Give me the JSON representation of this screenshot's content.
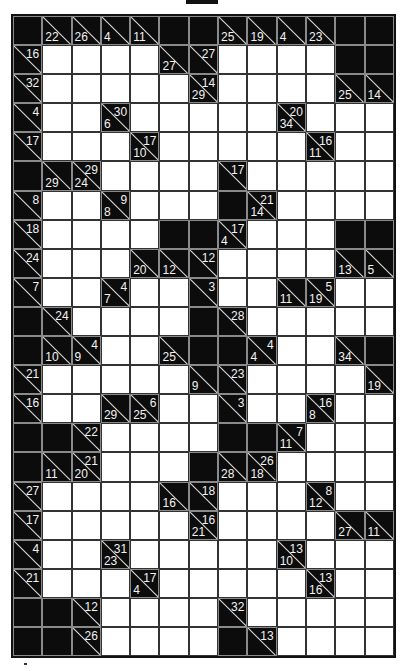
{
  "puzzle": {
    "type": "kakuro",
    "rows": 22,
    "cols": 13,
    "legend": {
      "B": "black block",
      "W": "white entry cell",
      "clue": "d = down sum (bottom-left), r = right sum (top-right)"
    },
    "grid": [
      [
        "B",
        {
          "d": 22
        },
        {
          "d": 26
        },
        {
          "d": 4
        },
        {
          "d": 11
        },
        "B",
        "B",
        {
          "d": 25
        },
        {
          "d": 19
        },
        {
          "d": 4
        },
        {
          "d": 23
        },
        "B",
        "B"
      ],
      [
        {
          "r": 16
        },
        "W",
        "W",
        "W",
        "W",
        {
          "d": 27
        },
        {
          "r": 27
        },
        "W",
        "W",
        "W",
        "W",
        "B",
        "B"
      ],
      [
        {
          "r": 32
        },
        "W",
        "W",
        "W",
        "W",
        "W",
        {
          "d": 29,
          "r": 14
        },
        "W",
        "W",
        "W",
        "W",
        {
          "d": 25
        },
        {
          "d": 14
        }
      ],
      [
        {
          "r": 4
        },
        "W",
        "W",
        {
          "d": 6,
          "r": 30
        },
        "W",
        "W",
        "W",
        "W",
        "W",
        {
          "d": 34,
          "r": 20
        },
        "W",
        "W",
        "W"
      ],
      [
        {
          "r": 17
        },
        "W",
        "W",
        "W",
        {
          "d": 10,
          "r": 17
        },
        "W",
        "W",
        "W",
        "W",
        "W",
        {
          "d": 11,
          "r": 16
        },
        "W",
        "W"
      ],
      [
        "B",
        {
          "d": 29
        },
        {
          "d": 24,
          "r": 29
        },
        "W",
        "W",
        "W",
        "W",
        {
          "r": 17
        },
        "W",
        "W",
        "W",
        "W",
        "W"
      ],
      [
        {
          "r": 8
        },
        "W",
        "W",
        {
          "d": 8,
          "r": 9
        },
        "W",
        "W",
        "W",
        "B",
        {
          "d": 14,
          "r": 21
        },
        "W",
        "W",
        "W",
        "W"
      ],
      [
        {
          "r": 18
        },
        "W",
        "W",
        "W",
        "W",
        "B",
        "B",
        {
          "d": 4,
          "r": 17
        },
        "W",
        "W",
        "W",
        "B",
        "B"
      ],
      [
        {
          "r": 24
        },
        "W",
        "W",
        "W",
        {
          "d": 20
        },
        {
          "d": 12
        },
        {
          "r": 12
        },
        "W",
        "W",
        "W",
        "W",
        {
          "d": 13
        },
        {
          "d": 5
        }
      ],
      [
        {
          "r": 7
        },
        "W",
        "W",
        {
          "d": 7,
          "r": 4
        },
        "W",
        "W",
        {
          "r": 3
        },
        "W",
        "W",
        {
          "d": 11
        },
        {
          "d": 19,
          "r": 5
        },
        "W",
        "W"
      ],
      [
        "B",
        {
          "r": 24
        },
        "W",
        "W",
        "W",
        "W",
        "B",
        {
          "r": 28
        },
        "W",
        "W",
        "W",
        "W",
        "W"
      ],
      [
        "B",
        {
          "d": 10
        },
        {
          "d": 9,
          "r": 4
        },
        "W",
        "W",
        {
          "d": 25
        },
        "B",
        "B",
        {
          "d": 4,
          "r": 4
        },
        "W",
        "W",
        {
          "d": 34
        },
        "B"
      ],
      [
        {
          "r": 21
        },
        "W",
        "W",
        "W",
        "W",
        "W",
        {
          "d": 9
        },
        {
          "r": 23
        },
        "W",
        "W",
        "W",
        "W",
        {
          "d": 19
        }
      ],
      [
        {
          "r": 16
        },
        "W",
        "W",
        {
          "d": 29
        },
        {
          "d": 25,
          "r": 6
        },
        "W",
        "W",
        {
          "r": 3
        },
        "W",
        "W",
        {
          "d": 8,
          "r": 16
        },
        "W",
        "W"
      ],
      [
        "B",
        "B",
        {
          "r": 22
        },
        "W",
        "W",
        "W",
        "W",
        "B",
        "B",
        {
          "d": 11,
          "r": 7
        },
        "W",
        "W",
        "W"
      ],
      [
        "B",
        {
          "d": 11
        },
        {
          "d": 20,
          "r": 21
        },
        "W",
        "W",
        "W",
        "B",
        {
          "d": 28
        },
        {
          "d": 18,
          "r": 26
        },
        "W",
        "W",
        "W",
        "W"
      ],
      [
        {
          "r": 27
        },
        "W",
        "W",
        "W",
        "W",
        {
          "d": 16
        },
        {
          "r": 18
        },
        "W",
        "W",
        "W",
        {
          "d": 12,
          "r": 8
        },
        "W",
        "W"
      ],
      [
        {
          "r": 17
        },
        "W",
        "W",
        "W",
        "W",
        "W",
        {
          "d": 21,
          "r": 16
        },
        "W",
        "W",
        "W",
        "W",
        {
          "d": 27
        },
        {
          "d": 11
        }
      ],
      [
        {
          "r": 4
        },
        "W",
        "W",
        {
          "d": 23,
          "r": 31
        },
        "W",
        "W",
        "W",
        "W",
        "W",
        {
          "d": 10,
          "r": 13
        },
        "W",
        "W",
        "W"
      ],
      [
        {
          "r": 21
        },
        "W",
        "W",
        "W",
        {
          "d": 4,
          "r": 17
        },
        "W",
        "W",
        "W",
        "W",
        "W",
        {
          "d": 16,
          "r": 13
        },
        "W",
        "W"
      ],
      [
        "B",
        "B",
        {
          "r": 12
        },
        "W",
        "W",
        "W",
        "W",
        {
          "r": 32
        },
        "W",
        "W",
        "W",
        "W",
        "W"
      ],
      [
        "B",
        "B",
        {
          "r": 26
        },
        "W",
        "W",
        "W",
        "W",
        "B",
        {
          "r": 13
        },
        "W",
        "W",
        "W",
        "W"
      ]
    ]
  },
  "colors": {
    "block": "#0c0c0c",
    "entry": "#ffffff",
    "clue_text": "#f2f2f2",
    "grid_line": "#333333"
  }
}
